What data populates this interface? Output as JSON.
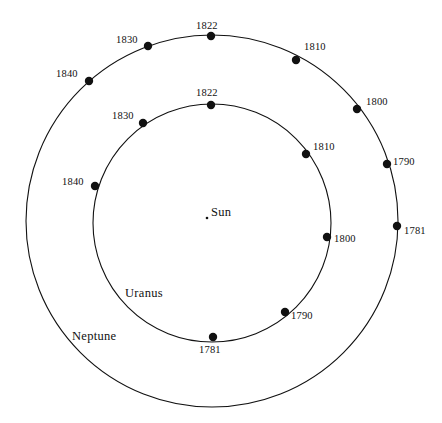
{
  "figure": {
    "background_color": "#ffffff",
    "stroke_color": "#111111",
    "marker_color": "#111111",
    "width": 442,
    "height": 423
  },
  "labels": {
    "sun": "Sun",
    "uranus": "Uranus",
    "neptune": "Neptune"
  },
  "chart_data": {
    "type": "scatter",
    "xlabel": "",
    "ylabel": "",
    "grid": false,
    "legend": "none",
    "center": {
      "x": 212,
      "y": 221,
      "label": "Sun"
    },
    "orbits": [
      {
        "name": "Neptune",
        "label": "Neptune",
        "label_x": 72,
        "label_y": 337,
        "center_x": 212,
        "center_y": 221,
        "radius": 186,
        "markers": [
          {
            "year": "1822",
            "x": 211,
            "y": 36,
            "label_x": 196,
            "label_y": 21,
            "label_anchor": "start"
          },
          {
            "year": "1830",
            "x": 148,
            "y": 46,
            "label_x": 116,
            "label_y": 35,
            "label_anchor": "start"
          },
          {
            "year": "1840",
            "x": 89,
            "y": 81,
            "label_x": 56,
            "label_y": 69,
            "label_anchor": "start"
          },
          {
            "year": "1810",
            "x": 296,
            "y": 60,
            "label_x": 304,
            "label_y": 42,
            "label_anchor": "start"
          },
          {
            "year": "1800",
            "x": 357,
            "y": 109,
            "label_x": 366,
            "label_y": 97,
            "label_anchor": "start"
          },
          {
            "year": "1790",
            "x": 387,
            "y": 164,
            "label_x": 393,
            "label_y": 157,
            "label_anchor": "start"
          },
          {
            "year": "1781",
            "x": 397,
            "y": 226,
            "label_x": 404,
            "label_y": 226,
            "label_anchor": "start"
          }
        ]
      },
      {
        "name": "Uranus",
        "label": "Uranus",
        "label_x": 125,
        "label_y": 287,
        "center_x": 212,
        "center_y": 223,
        "radius": 119,
        "markers": [
          {
            "year": "1822",
            "x": 211,
            "y": 105,
            "label_x": 196,
            "label_y": 88,
            "label_anchor": "start"
          },
          {
            "year": "1830",
            "x": 143,
            "y": 123,
            "label_x": 112,
            "label_y": 111,
            "label_anchor": "start"
          },
          {
            "year": "1840",
            "x": 95,
            "y": 186,
            "label_x": 62,
            "label_y": 177,
            "label_anchor": "start"
          },
          {
            "year": "1810",
            "x": 306,
            "y": 154,
            "label_x": 313,
            "label_y": 142,
            "label_anchor": "start"
          },
          {
            "year": "1800",
            "x": 327,
            "y": 237,
            "label_x": 334,
            "label_y": 234,
            "label_anchor": "start"
          },
          {
            "year": "1790",
            "x": 285,
            "y": 312,
            "label_x": 291,
            "label_y": 311,
            "label_anchor": "start"
          },
          {
            "year": "1781",
            "x": 213,
            "y": 337,
            "label_x": 199,
            "label_y": 345,
            "label_anchor": "start"
          }
        ]
      }
    ]
  }
}
